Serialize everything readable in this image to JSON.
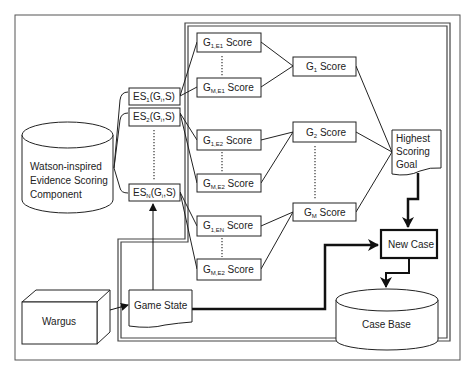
{
  "diagram": {
    "components": {
      "watson": {
        "line1": "Watson-inspired",
        "line2": "Evidence Scoring",
        "line3": "Component"
      },
      "wargus": "Wargus",
      "game_state": "Game State",
      "highest": {
        "line1": "Highest",
        "line2": "Scoring",
        "line3": "Goal"
      },
      "new_case": "New Case",
      "case_base": "Case Base"
    },
    "evidence_scorers": [
      {
        "base": "ES",
        "sub": "1",
        "args_pre": "(G",
        "args_sub": "i",
        "args_post": ",S)"
      },
      {
        "base": "ES",
        "sub": "2",
        "args_pre": "(G",
        "args_sub": "i",
        "args_post": ",S)"
      },
      {
        "base": "ES",
        "sub": "N",
        "args_pre": "(G",
        "args_sub": "i",
        "args_post": ",S)"
      }
    ],
    "goal_evidence_scores": [
      {
        "base": "G",
        "sub": "1,E1",
        "suffix": " Score"
      },
      {
        "base": "G",
        "sub": "M,E1",
        "suffix": " Score"
      },
      {
        "base": "G",
        "sub": "1,E2",
        "suffix": " Score"
      },
      {
        "base": "G",
        "sub": "M,E2",
        "suffix": " Score"
      },
      {
        "base": "G",
        "sub": "1,EN",
        "suffix": " Score"
      },
      {
        "base": "G",
        "sub": "M,E2",
        "suffix": " Score"
      }
    ],
    "goal_scores": [
      {
        "base": "G",
        "sub": "1",
        "suffix": " Score"
      },
      {
        "base": "G",
        "sub": "2",
        "suffix": " Score"
      },
      {
        "base": "G",
        "sub": "M",
        "suffix": " Score"
      }
    ]
  }
}
